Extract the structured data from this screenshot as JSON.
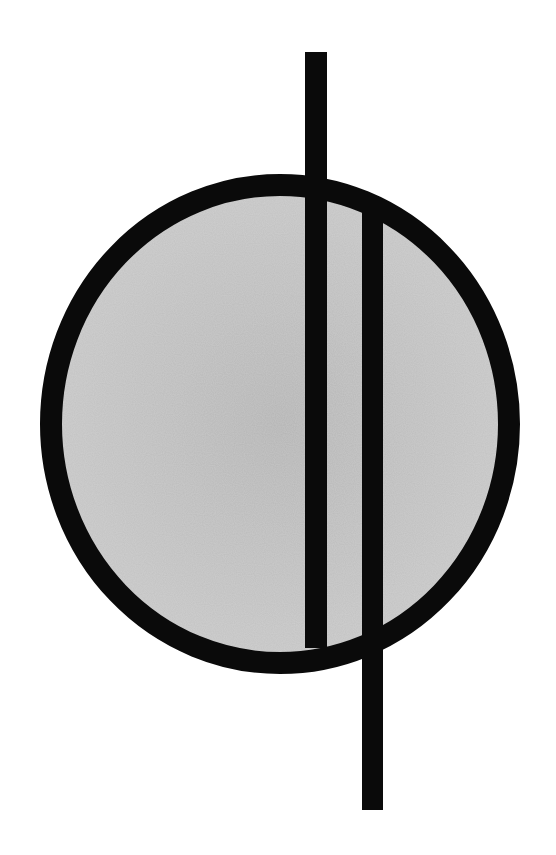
{
  "diagram": {
    "title": "",
    "background": "#ffffff",
    "ring": {
      "cx": 280,
      "cy": 424,
      "rx": 229,
      "ry": 239,
      "stroke_width": 22,
      "stroke": "#0a0a0a",
      "fill_center": "#b3b3b3",
      "fill_edge": "#c6c6c6"
    },
    "bars": [
      {
        "name": "left-vertical-bar",
        "x": 305,
        "y": 52,
        "width": 22,
        "height": 596,
        "color": "#0a0a0a"
      },
      {
        "name": "right-vertical-bar",
        "x": 362,
        "y": 212,
        "width": 21,
        "height": 598,
        "color": "#0a0a0a"
      }
    ]
  }
}
